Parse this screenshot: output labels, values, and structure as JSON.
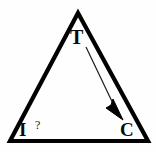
{
  "diagram": {
    "type": "triangle-relationship-diagram",
    "background_color": "#fefefe",
    "stroke_color": "#000000",
    "text_color": "#0b0b0b",
    "vertices": [
      {
        "id": "t",
        "label": "T",
        "position": "apex-top"
      },
      {
        "id": "i",
        "label": "I",
        "position": "bottom-left"
      },
      {
        "id": "c",
        "label": "C",
        "position": "bottom-right"
      }
    ],
    "annotations": {
      "question_mark": "?"
    },
    "arrow": {
      "from": "T",
      "to": "C",
      "style": "thin-line-with-filled-arrowhead"
    }
  }
}
